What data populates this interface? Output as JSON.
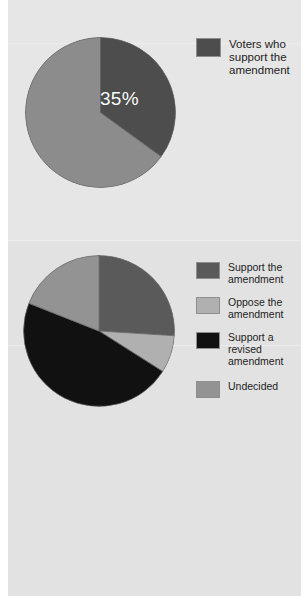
{
  "page": {
    "background_color": "#ffffff",
    "panel_color": "#e4e4e4"
  },
  "chart_data": [
    {
      "type": "pie",
      "id": "support-pie",
      "title": "",
      "categories": [
        "Voters who support the amendment",
        "Other voters"
      ],
      "values": [
        35,
        65
      ],
      "data_labels": [
        "35%",
        ""
      ],
      "colors": [
        "#4d4d4d",
        "#8c8c8c"
      ],
      "start_angle": 0,
      "direction": "clockwise",
      "legend_position": "right",
      "legend_entries": [
        {
          "label": "Voters who support the amendment",
          "color": "#4d4d4d"
        }
      ]
    },
    {
      "type": "pie",
      "id": "opinion-breakdown-pie",
      "title": "",
      "categories": [
        "Support the amendment",
        "Oppose the amendment",
        "Support a revised amendment",
        "Undecided"
      ],
      "values": [
        26,
        8,
        47,
        19
      ],
      "data_labels": [
        "",
        "",
        "",
        ""
      ],
      "colors": [
        "#5a5a5a",
        "#b0b0b0",
        "#111111",
        "#939393"
      ],
      "start_angle": 0,
      "direction": "clockwise",
      "legend_position": "right",
      "legend_entries": [
        {
          "label": "Support the amendment",
          "color": "#5a5a5a"
        },
        {
          "label": "Oppose the amendment",
          "color": "#b0b0b0"
        },
        {
          "label": "Support a revised amendment",
          "color": "#111111"
        },
        {
          "label": "Undecided",
          "color": "#939393"
        }
      ]
    }
  ]
}
